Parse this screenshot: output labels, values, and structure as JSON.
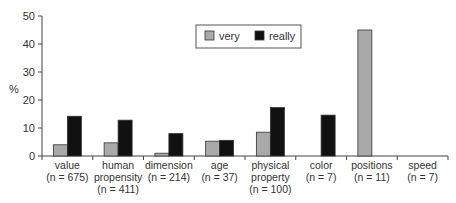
{
  "chart_data": {
    "type": "bar",
    "title": "",
    "xlabel": "",
    "ylabel": "%",
    "ylim": [
      0,
      50
    ],
    "yticks": [
      0,
      10,
      20,
      30,
      40,
      50
    ],
    "grid": false,
    "legend_position": "top-center",
    "categories": [
      {
        "label": "value",
        "n": "(n = 675)"
      },
      {
        "label": "human propensity",
        "n": "(n = 411)"
      },
      {
        "label": "dimension",
        "n": "(n = 214)"
      },
      {
        "label": "age",
        "n": "(n = 37)"
      },
      {
        "label": "physical property",
        "n": "(n = 100)"
      },
      {
        "label": "color",
        "n": "(n = 7)"
      },
      {
        "label": "positions",
        "n": "(n = 11)"
      },
      {
        "label": "speed",
        "n": "(n = 7)"
      }
    ],
    "series": [
      {
        "name": "very",
        "color": "#a9a9a9",
        "values": [
          4.0,
          4.7,
          1.0,
          5.3,
          8.5,
          0,
          45.0,
          0
        ]
      },
      {
        "name": "really",
        "color": "#111111",
        "values": [
          14.2,
          12.8,
          8.0,
          5.6,
          17.3,
          14.6,
          0,
          0
        ]
      }
    ]
  }
}
